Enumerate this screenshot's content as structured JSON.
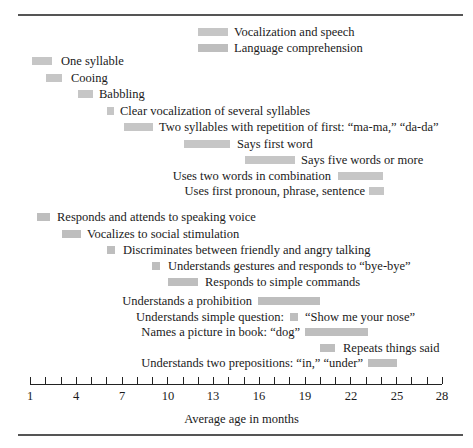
{
  "chart_data": {
    "type": "gantt-bar",
    "title": "",
    "xlabel": "Average age in months",
    "ylabel": "",
    "xlim": [
      1,
      28
    ],
    "xticks_labeled": [
      1,
      4,
      7,
      10,
      13,
      16,
      19,
      22,
      25,
      28
    ],
    "xticks_minor_step": 1,
    "legend": [
      {
        "name": "Vocalization and speech",
        "color": "#c6c6c6"
      },
      {
        "name": "Language comprehension",
        "color": "#bebebe"
      }
    ],
    "series": [
      {
        "name": "Vocalization and speech",
        "items": [
          {
            "label": "One syllable",
            "start": 1.1,
            "end": 2.5,
            "label_side": "right"
          },
          {
            "label": "Cooing",
            "start": 2.1,
            "end": 3.1,
            "label_side": "right"
          },
          {
            "label": "Babbling",
            "start": 4.1,
            "end": 5.1,
            "label_side": "right"
          },
          {
            "label": "Clear vocalization of several syllables",
            "start": 6.1,
            "end": 6.6,
            "label_side": "right"
          },
          {
            "label": "Two syllables with repetition of first: “ma-ma,” “da-da”",
            "start": 7.2,
            "end": 9.1,
            "label_side": "right"
          },
          {
            "label": "Says first word",
            "start": 11.1,
            "end": 14.1,
            "label_side": "right"
          },
          {
            "label": "Says five words or more",
            "start": 15.1,
            "end": 18.4,
            "label_side": "right"
          },
          {
            "label": "Uses two words in combination",
            "start": 21.2,
            "end": 24.1,
            "label_side": "left"
          },
          {
            "label": "Uses first pronoun, phrase, sentence",
            "start": 23.2,
            "end": 24.2,
            "label_side": "left"
          }
        ]
      },
      {
        "name": "Language comprehension",
        "items": [
          {
            "label": "Responds and attends to speaking voice",
            "start": 1.5,
            "end": 2.3,
            "label_side": "right"
          },
          {
            "label": "Vocalizes to social stimulation",
            "start": 3.1,
            "end": 4.3,
            "label_side": "right"
          },
          {
            "label": "Discriminates between friendly and angry talking",
            "start": 6.1,
            "end": 6.6,
            "label_side": "right"
          },
          {
            "label": "Understands gestures and responds to “bye-bye”",
            "start": 9.0,
            "end": 9.5,
            "label_side": "right"
          },
          {
            "label": "Responds to simple commands",
            "start": 10.1,
            "end": 12.1,
            "label_side": "right"
          },
          {
            "label": "Understands a prohibition",
            "start": 15.9,
            "end": 20.0,
            "label_side": "left"
          },
          {
            "label": "Understands simple question:",
            "label_after": "“Show me your nose”",
            "start": 18.0,
            "end": 18.5,
            "label_side": "both"
          },
          {
            "label": "Names a picture in book: “dog”",
            "start": 19.0,
            "end": 23.1,
            "label_side": "left"
          },
          {
            "label": "Repeats things said",
            "start": 20.0,
            "end": 21.0,
            "label_side": "right"
          },
          {
            "label": "Understands two prepositions: “in,” “under”",
            "start": 23.1,
            "end": 25.0,
            "label_side": "left"
          }
        ]
      }
    ]
  },
  "legend": {
    "speech": "Vocalization and speech",
    "comprehension": "Language comprehension"
  },
  "axis": {
    "label": "Average age in months",
    "ticks": [
      "1",
      "4",
      "7",
      "10",
      "13",
      "16",
      "19",
      "22",
      "25",
      "28"
    ]
  },
  "rows": {
    "speech": [
      "One syllable",
      "Cooing",
      "Babbling",
      "Clear vocalization of several syllables",
      "Two syllables with repetition of first: “ma-ma,” “da-da”",
      "Says first word",
      "Says five words or more",
      "Uses two words in combination",
      "Uses first pronoun, phrase, sentence"
    ],
    "comprehension": [
      "Responds and attends to speaking voice",
      "Vocalizes to social stimulation",
      "Discriminates between friendly and angry talking",
      "Understands gestures and responds to “bye-bye”",
      "Responds to simple commands",
      "Understands a prohibition",
      "Understands simple question:",
      "“Show me your nose”",
      "Names a picture in book: “dog”",
      "Repeats things said",
      "Understands two prepositions: “in,” “under”"
    ]
  }
}
